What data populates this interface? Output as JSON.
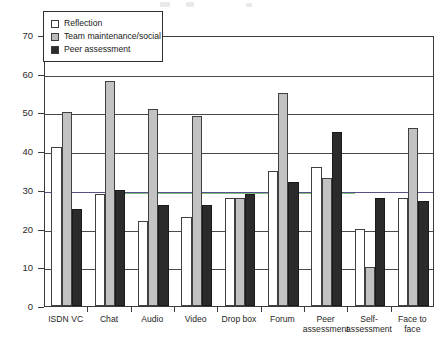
{
  "chart_data": {
    "type": "bar",
    "title": "",
    "xlabel": "",
    "ylabel": "",
    "ylim": [
      0,
      70
    ],
    "ytick_step": 10,
    "yticks": [
      "0",
      "10",
      "20",
      "30",
      "40",
      "50",
      "60",
      "70"
    ],
    "grid": true,
    "legend_position": "top-left",
    "categories": [
      "ISDN VC",
      "Chat",
      "Audio",
      "Video",
      "Drop box",
      "Forum",
      "Peer assessment",
      "Self-assessment",
      "Face to face"
    ],
    "series": [
      {
        "name": "Reflection",
        "color": "#ffffff",
        "values": [
          41,
          29,
          22,
          23,
          28,
          35,
          36,
          20,
          28
        ]
      },
      {
        "name": "Team maintenance/social",
        "color": "#c2c2c2",
        "values": [
          50,
          58,
          51,
          49,
          28,
          55,
          33,
          10,
          46
        ]
      },
      {
        "name": "Peer assessment",
        "color": "#2b2b2b",
        "values": [
          25,
          30,
          26,
          26,
          29,
          32,
          45,
          28,
          27
        ]
      }
    ]
  },
  "legend": {
    "items": [
      {
        "label": "Reflection",
        "swatch": "reflection"
      },
      {
        "label": "Team maintenance/social",
        "swatch": "team"
      },
      {
        "label": "Peer assessment",
        "swatch": "peer"
      }
    ]
  },
  "axis": {
    "y_labels": [
      "70",
      "60",
      "50",
      "40",
      "30",
      "20",
      "10",
      "0"
    ],
    "x_labels": [
      "ISDN VC",
      "Chat",
      "Audio",
      "Video",
      "Drop box",
      "Forum",
      "Peer\nassessment",
      "Self-\nassessment",
      "Face to\nface"
    ]
  }
}
